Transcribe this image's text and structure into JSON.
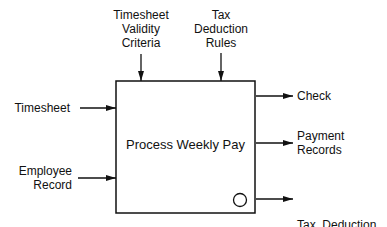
{
  "diagram": {
    "type": "IDEF0 activity box",
    "activity": {
      "label": "Process Weekly Pay"
    },
    "inputs": [
      {
        "label": "Timesheet"
      },
      {
        "label_line1": "Employee",
        "label_line2": "Record"
      }
    ],
    "controls": [
      {
        "label_line1": "Timesheet",
        "label_line2": "Validity",
        "label_line3": "Criteria"
      },
      {
        "label_line1": "Tax",
        "label_line2": "Deduction",
        "label_line3": "Rules"
      }
    ],
    "outputs": [
      {
        "label": "Check"
      },
      {
        "label_line1": "Payment",
        "label_line2": "Records"
      },
      {
        "label_line1": "Tax  Deduction",
        "label_line2": "Record"
      }
    ],
    "colors": {
      "line": "#111111",
      "background": "#ffffff"
    }
  }
}
